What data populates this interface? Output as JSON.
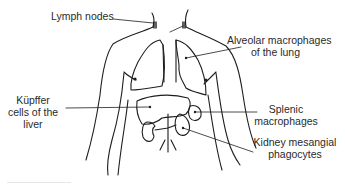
{
  "figure": {
    "type": "anatomical-diagram",
    "line_color": "#1e1e1e",
    "text_color": "#2a2a2a",
    "background": "#ffffff"
  },
  "labels": {
    "lymph_nodes": "Lymph nodes",
    "alveolar": {
      "line1": "Alveolar macrophages",
      "line2": "of the lung"
    },
    "kupffer": {
      "line1": "Küpffer",
      "line2": "cells of the",
      "line3": "liver"
    },
    "splenic": {
      "line1": "Splenic",
      "line2": "macrophages"
    },
    "kidney": {
      "line1": "Kidney mesangial",
      "line2": "phagocytes"
    }
  },
  "organs": [
    "neck-lymph-nodes",
    "left-lung",
    "right-lung",
    "axillary-lymph-nodes",
    "liver",
    "spleen",
    "left-kidney",
    "right-kidney",
    "aorta"
  ]
}
